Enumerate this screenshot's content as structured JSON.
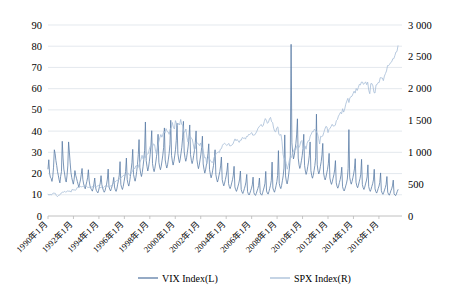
{
  "chart_data": {
    "type": "line",
    "title": "",
    "xlabel": "",
    "ylabel": "",
    "grid": true,
    "legend_position": "bottom",
    "x_tick_labels": [
      "1990年1月",
      "1992年1月",
      "1994年1月",
      "1996年1月",
      "1998年1月",
      "2000年1月",
      "2002年1月",
      "2004年1月",
      "2006年1月",
      "2008年1月",
      "2010年1月",
      "2012年1月",
      "2014年1月",
      "2016年1月"
    ],
    "x_range": [
      "1990年1月",
      "2017年6月"
    ],
    "left_axis": {
      "label": "VIX Index(L)",
      "ylim": [
        0,
        90
      ],
      "tick_step": 10,
      "tick_labels": [
        "0",
        "10",
        "20",
        "30",
        "40",
        "50",
        "60",
        "70",
        "80",
        "90"
      ]
    },
    "right_axis": {
      "label": "SPX Index(R)",
      "ylim": [
        0,
        3000
      ],
      "tick_step": 500,
      "tick_labels": [
        "0",
        "500",
        "1 000",
        "1 500",
        "2 000",
        "2 500",
        "3 000"
      ]
    },
    "series": [
      {
        "name": "VIX Index(L)",
        "axis": "left",
        "color": "#5b7ca6",
        "values": [
          22.2,
          26.5,
          20.1,
          18.3,
          17.7,
          16.3,
          18.5,
          23.0,
          31.2,
          29.4,
          26.1,
          23.8,
          21.0,
          19.2,
          17.1,
          15.6,
          18.7,
          20.9,
          35.2,
          27.3,
          22.1,
          19.8,
          17.2,
          16.0,
          18.9,
          23.6,
          34.9,
          30.1,
          25.0,
          20.5,
          18.1,
          16.4,
          15.0,
          17.3,
          21.4,
          19.2,
          17.8,
          16.3,
          14.9,
          13.6,
          15.4,
          17.0,
          19.6,
          22.4,
          17.3,
          15.1,
          13.9,
          12.8,
          14.6,
          16.2,
          18.0,
          21.8,
          16.5,
          14.2,
          13.1,
          12.4,
          11.7,
          13.0,
          15.1,
          17.9,
          13.6,
          12.1,
          11.4,
          10.9,
          12.2,
          13.8,
          15.6,
          19.0,
          14.8,
          13.2,
          12.0,
          11.2,
          11.9,
          13.5,
          15.0,
          17.4,
          22.1,
          13.9,
          12.6,
          11.8,
          12.9,
          14.2,
          15.5,
          18.2,
          13.7,
          12.3,
          11.6,
          12.8,
          15.0,
          16.8,
          19.3,
          25.6,
          14.9,
          13.4,
          12.5,
          13.9,
          16.1,
          18.4,
          21.0,
          27.3,
          17.2,
          15.3,
          14.1,
          15.9,
          18.6,
          21.7,
          25.1,
          31.4,
          19.6,
          17.8,
          16.4,
          18.2,
          21.0,
          24.3,
          28.9,
          36.0,
          22.8,
          20.1,
          18.6,
          20.4,
          23.2,
          26.5,
          31.0,
          44.3,
          26.1,
          23.4,
          21.2,
          23.0,
          25.8,
          28.9,
          33.4,
          40.2,
          24.7,
          22.3,
          20.9,
          22.6,
          25.0,
          27.9,
          31.6,
          38.5,
          25.3,
          23.1,
          21.8,
          23.5,
          26.0,
          28.7,
          32.2,
          41.5,
          26.4,
          24.2,
          22.6,
          24.1,
          26.8,
          29.5,
          33.8,
          45.1,
          28.6,
          25.9,
          24.0,
          25.7,
          28.3,
          31.2,
          35.6,
          43.7,
          29.4,
          26.8,
          25.1,
          26.9,
          29.6,
          32.4,
          36.8,
          44.6,
          30.2,
          27.5,
          25.8,
          27.4,
          30.0,
          32.9,
          37.1,
          42.9,
          28.9,
          26.3,
          24.7,
          26.2,
          28.6,
          31.0,
          34.5,
          40.1,
          26.8,
          24.1,
          22.3,
          23.9,
          26.4,
          28.8,
          32.1,
          37.6,
          24.5,
          22.0,
          20.2,
          21.7,
          24.0,
          26.2,
          29.4,
          34.0,
          21.9,
          19.7,
          18.0,
          19.4,
          21.6,
          23.8,
          26.9,
          31.2,
          19.5,
          17.4,
          16.0,
          17.3,
          19.2,
          21.0,
          23.6,
          27.8,
          17.1,
          15.4,
          14.2,
          15.5,
          17.2,
          18.9,
          21.3,
          25.0,
          15.3,
          13.8,
          12.9,
          14.0,
          15.6,
          17.1,
          19.2,
          23.4,
          13.7,
          12.4,
          11.6,
          12.7,
          14.1,
          15.5,
          17.4,
          21.2,
          12.5,
          11.3,
          10.6,
          11.6,
          12.9,
          14.2,
          16.0,
          19.6,
          11.5,
          10.4,
          9.9,
          10.8,
          12.0,
          13.1,
          14.7,
          18.3,
          11.0,
          10.1,
          9.7,
          10.6,
          11.8,
          12.9,
          14.4,
          17.9,
          10.9,
          10.2,
          9.8,
          10.9,
          12.3,
          13.6,
          15.4,
          21.0,
          11.8,
          10.8,
          10.3,
          11.5,
          13.0,
          14.5,
          16.8,
          25.4,
          13.2,
          12.0,
          11.2,
          12.5,
          14.3,
          16.2,
          19.1,
          30.8,
          15.4,
          13.8,
          12.9,
          14.4,
          16.6,
          18.9,
          22.6,
          38.2,
          18.9,
          16.4,
          15.1,
          17.0,
          19.8,
          23.1,
          28.4,
          80.9,
          34.5,
          29.8,
          26.9,
          28.6,
          31.4,
          34.0,
          38.2,
          45.8,
          27.3,
          24.1,
          22.4,
          23.8,
          26.0,
          28.4,
          31.8,
          38.5,
          23.9,
          21.2,
          19.6,
          21.0,
          23.2,
          25.4,
          28.6,
          34.9,
          21.4,
          19.0,
          17.8,
          19.2,
          21.4,
          23.8,
          27.4,
          48.0,
          24.1,
          21.3,
          19.8,
          21.2,
          23.4,
          25.6,
          28.8,
          34.2,
          20.3,
          18.2,
          17.0,
          18.3,
          20.2,
          22.0,
          24.6,
          29.5,
          17.9,
          16.0,
          14.9,
          16.1,
          17.8,
          19.4,
          21.7,
          26.1,
          15.6,
          14.0,
          13.1,
          14.2,
          15.8,
          17.2,
          19.3,
          23.0,
          13.8,
          12.5,
          11.8,
          12.8,
          14.2,
          15.5,
          17.4,
          22.4,
          40.7,
          18.3,
          16.2,
          15.0,
          16.3,
          18.0,
          19.8,
          22.2,
          27.0,
          15.9,
          14.2,
          13.3,
          14.5,
          16.1,
          17.6,
          19.7,
          26.7,
          14.8,
          13.3,
          12.5,
          13.6,
          15.1,
          16.5,
          18.4,
          24.1,
          13.9,
          12.4,
          11.6,
          12.6,
          14.0,
          15.2,
          17.0,
          22.0,
          12.8,
          11.5,
          10.8,
          11.7,
          13.0,
          14.1,
          15.8,
          20.3,
          11.9,
          10.8,
          10.2,
          11.1,
          12.3,
          13.4,
          14.9,
          18.6,
          11.2,
          10.3,
          9.8,
          10.7,
          11.9,
          12.8,
          14.2,
          16.9,
          10.6,
          9.9,
          9.6,
          10.4,
          11.5,
          12.4
        ]
      },
      {
        "name": "SPX Index(R)",
        "axis": "right",
        "color": "#a6bdd7",
        "values": [
          339,
          330,
          339,
          331,
          340,
          361,
          358,
          356,
          322,
          304,
          322,
          330,
          343,
          367,
          375,
          375,
          389,
          371,
          387,
          395,
          388,
          392,
          375,
          417,
          409,
          412,
          403,
          414,
          450,
          447,
          448,
          463,
          458,
          463,
          462,
          466,
          481,
          467,
          446,
          450,
          450,
          444,
          458,
          463,
          467,
          472,
          453,
          466,
          481,
          467,
          445,
          450,
          456,
          444,
          458,
          475,
          462,
          472,
          453,
          459,
          470,
          487,
          500,
          514,
          533,
          544,
          562,
          562,
          584,
          581,
          605,
          615,
          636,
          640,
          645,
          654,
          669,
          670,
          639,
          651,
          687,
          705,
          757,
          740,
          786,
          790,
          757,
          801,
          848,
          885,
          954,
          899,
          947,
          914,
          955,
          970,
          980,
          1049,
          1101,
          1111,
          1090,
          1133,
          1120,
          1017,
          957,
          1098,
          1163,
          1229,
          1279,
          1238,
          1286,
          1335,
          1301,
          1372,
          1328,
          1320,
          1282,
          1362,
          1388,
          1469,
          1394,
          1366,
          1498,
          1452,
          1420,
          1454,
          1430,
          1517,
          1436,
          1429,
          1314,
          1320,
          1366,
          1239,
          1160,
          1249,
          1255,
          1224,
          1211,
          1133,
          1040,
          1059,
          1139,
          1148,
          1130,
          1106,
          1147,
          1076,
          1067,
          989,
          911,
          916,
          815,
          885,
          936,
          879,
          855,
          841,
          848,
          916,
          963,
          974,
          990,
          1008,
          995,
          1050,
          1058,
          1111,
          1131,
          1144,
          1126,
          1107,
          1120,
          1140,
          1101,
          1104,
          1114,
          1130,
          1173,
          1211,
          1181,
          1203,
          1180,
          1156,
          1191,
          1191,
          1234,
          1220,
          1228,
          1207,
          1249,
          1248,
          1280,
          1280,
          1294,
          1310,
          1270,
          1270,
          1276,
          1303,
          1335,
          1377,
          1400,
          1418,
          1438,
          1406,
          1420,
          1482,
          1530,
          1503,
          1455,
          1473,
          1526,
          1549,
          1481,
          1468,
          1378,
          1330,
          1322,
          1385,
          1400,
          1280,
          1267,
          1282,
          1166,
          968,
          896,
          903,
          825,
          735,
          797,
          872,
          919,
          919,
          987,
          1020,
          1057,
          1036,
          1095,
          1115,
          1073,
          1104,
          1169,
          1186,
          1089,
          1030,
          1101,
          1049,
          1141,
          1183,
          1180,
          1257,
          1286,
          1327,
          1325,
          1363,
          1345,
          1320,
          1292,
          1218,
          1131,
          1253,
          1246,
          1257,
          1312,
          1365,
          1408,
          1397,
          1310,
          1362,
          1379,
          1406,
          1440,
          1412,
          1416,
          1426,
          1498,
          1514,
          1569,
          1597,
          1630,
          1606,
          1685,
          1632,
          1681,
          1756,
          1805,
          1848,
          1782,
          1859,
          1872,
          1883,
          1923,
          1960,
          1930,
          2003,
          1972,
          2018,
          2067,
          2058,
          2104,
          2104,
          2067,
          2085,
          2107,
          2063,
          2103,
          1972,
          1920,
          2079,
          2080,
          2043,
          1940,
          1932,
          2059,
          2065,
          2096,
          2098,
          2173,
          2170,
          2168,
          2126,
          2198,
          2238,
          2278,
          2363,
          2362,
          2384,
          2411,
          2423,
          2470,
          2471,
          2519,
          2575,
          2584,
          2673
        ]
      }
    ]
  },
  "legend": {
    "items": [
      {
        "label": "VIX Index(L)",
        "color": "#5b7ca6"
      },
      {
        "label": "SPX Index(R)",
        "color": "#a6bdd7"
      }
    ]
  }
}
